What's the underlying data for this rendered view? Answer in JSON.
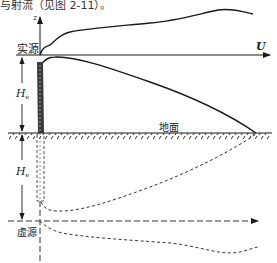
{
  "caption": "与射流（见图 2-11）。",
  "labels": {
    "z_axis": "z",
    "real_source": "实源",
    "wind": "U",
    "height_top": "H",
    "height_top_sub": "e",
    "ground": "地面",
    "height_bottom": "H",
    "height_bottom_sub": "e",
    "virtual_source": "虚源"
  },
  "colors": {
    "line": "#1a1a1a",
    "dashed": "#333333",
    "background": "#ffffff"
  }
}
